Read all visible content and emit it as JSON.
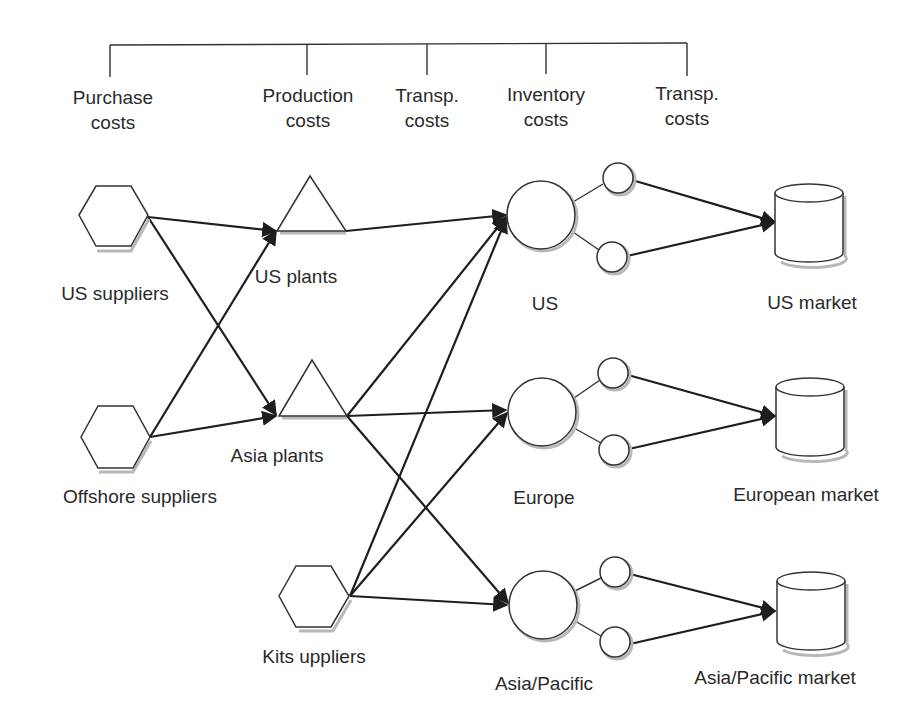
{
  "cost_bracket": {
    "categories": [
      {
        "line1": "Purchase",
        "line2": "costs",
        "x": 113
      },
      {
        "line1": "Production",
        "line2": "costs",
        "x": 308
      },
      {
        "line1": "Transp.",
        "line2": "costs",
        "x": 427
      },
      {
        "line1": "Inventory",
        "line2": "costs",
        "x": 546
      },
      {
        "line1": "Transp.",
        "line2": "costs",
        "x": 687
      }
    ]
  },
  "nodes": {
    "suppliers": [
      {
        "id": "us-suppliers",
        "label": "US suppliers",
        "shape": "hexagon"
      },
      {
        "id": "offshore-suppliers",
        "label": "Offshore suppliers",
        "shape": "hexagon"
      },
      {
        "id": "kit-suppliers",
        "label": "Kits uppliers",
        "shape": "hexagon"
      }
    ],
    "plants": [
      {
        "id": "us-plants",
        "label": "US plants",
        "shape": "triangle"
      },
      {
        "id": "asia-plants",
        "label": "Asia plants",
        "shape": "triangle"
      }
    ],
    "distribution_centers": [
      {
        "id": "dc-us",
        "label": "US",
        "shape": "circle"
      },
      {
        "id": "dc-europe",
        "label": "Europe",
        "shape": "circle"
      },
      {
        "id": "dc-asia-pacific",
        "label": "Asia/Pacific",
        "shape": "circle"
      }
    ],
    "markets": [
      {
        "id": "us-market",
        "label": "US market",
        "shape": "cylinder"
      },
      {
        "id": "european-market",
        "label": "European market",
        "shape": "cylinder"
      },
      {
        "id": "asia-pacific-market",
        "label": "Asia/Pacific market",
        "shape": "cylinder"
      }
    ]
  },
  "edges": [
    {
      "from": "us-suppliers",
      "to": "us-plants"
    },
    {
      "from": "us-suppliers",
      "to": "asia-plants"
    },
    {
      "from": "offshore-suppliers",
      "to": "us-plants"
    },
    {
      "from": "offshore-suppliers",
      "to": "asia-plants"
    },
    {
      "from": "us-plants",
      "to": "dc-us"
    },
    {
      "from": "asia-plants",
      "to": "dc-us"
    },
    {
      "from": "asia-plants",
      "to": "dc-europe"
    },
    {
      "from": "asia-plants",
      "to": "dc-asia-pacific"
    },
    {
      "from": "kit-suppliers",
      "to": "dc-us"
    },
    {
      "from": "kit-suppliers",
      "to": "dc-europe"
    },
    {
      "from": "kit-suppliers",
      "to": "dc-asia-pacific"
    },
    {
      "from": "dc-us",
      "to": "us-market",
      "via": "2 local warehouses"
    },
    {
      "from": "dc-europe",
      "to": "european-market",
      "via": "2 local warehouses"
    },
    {
      "from": "dc-asia-pacific",
      "to": "asia-pacific-market",
      "via": "2 local warehouses"
    }
  ],
  "colors": {
    "line": "#1e1e1e",
    "shape_stroke": "#333333",
    "shadow": "#b8b8b8",
    "background": "#ffffff"
  }
}
